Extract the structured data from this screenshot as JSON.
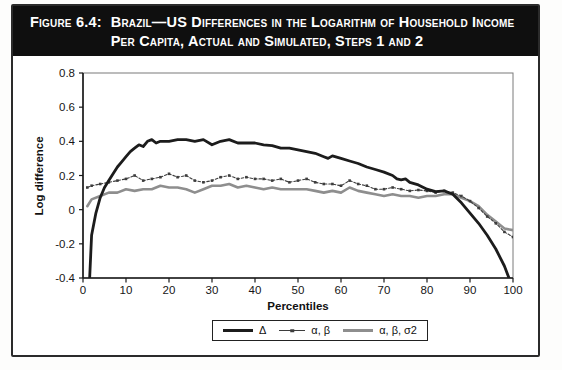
{
  "figure": {
    "label": "Figure 6.4:",
    "title": "Brazil—US Differences in the Logarithm of Household Income Per Capita, Actual and Simulated, Steps 1 and 2"
  },
  "chart_data": {
    "type": "line",
    "title": "",
    "xlabel": "Percentiles",
    "ylabel": "Log difference",
    "xlim": [
      0,
      100
    ],
    "ylim": [
      -0.4,
      0.8
    ],
    "x_ticks": [
      0,
      10,
      20,
      30,
      40,
      50,
      60,
      70,
      80,
      90,
      100
    ],
    "y_ticks": [
      0.8,
      0.6,
      0.4,
      0.2,
      0,
      -0.2,
      -0.4
    ],
    "grid": false,
    "legend_position": "bottom-center",
    "frame_color": "#7a7a7a",
    "axis_color": "#1a1a1a",
    "series": [
      {
        "name": "Δ",
        "style": "solid-thick",
        "color": "#1c1c1c",
        "x": [
          1.5,
          2,
          3,
          4,
          5,
          6,
          7,
          8,
          9,
          10,
          11,
          12,
          13,
          14,
          15,
          16,
          17,
          18,
          20,
          22,
          24,
          26,
          28,
          30,
          31,
          32,
          34,
          36,
          38,
          40,
          42,
          44,
          46,
          48,
          50,
          52,
          54,
          56,
          57,
          58,
          60,
          62,
          64,
          66,
          68,
          70,
          72,
          73,
          74,
          75,
          76,
          78,
          80,
          82,
          84,
          86,
          88,
          90,
          92,
          94,
          96,
          98,
          99.5
        ],
        "values": [
          -0.42,
          -0.15,
          -0.02,
          0.07,
          0.13,
          0.17,
          0.21,
          0.25,
          0.28,
          0.31,
          0.34,
          0.36,
          0.38,
          0.37,
          0.4,
          0.41,
          0.39,
          0.4,
          0.4,
          0.41,
          0.41,
          0.4,
          0.41,
          0.38,
          0.39,
          0.4,
          0.41,
          0.39,
          0.39,
          0.39,
          0.38,
          0.375,
          0.36,
          0.36,
          0.35,
          0.34,
          0.33,
          0.31,
          0.3,
          0.315,
          0.3,
          0.285,
          0.27,
          0.25,
          0.235,
          0.22,
          0.2,
          0.18,
          0.175,
          0.18,
          0.16,
          0.145,
          0.12,
          0.105,
          0.11,
          0.09,
          0.04,
          -0.02,
          -0.08,
          -0.15,
          -0.23,
          -0.33,
          -0.43
        ]
      },
      {
        "name": "α, β",
        "style": "dashed-square-markers",
        "color": "#3d3d3d",
        "x": [
          1,
          2,
          4,
          6,
          8,
          10,
          12,
          14,
          16,
          18,
          20,
          22,
          24,
          26,
          28,
          30,
          32,
          34,
          36,
          38,
          40,
          42,
          44,
          46,
          48,
          50,
          52,
          54,
          56,
          58,
          60,
          62,
          64,
          66,
          68,
          70,
          72,
          74,
          76,
          78,
          80,
          82,
          84,
          86,
          88,
          90,
          92,
          94,
          96,
          98,
          100
        ],
        "values": [
          0.13,
          0.14,
          0.15,
          0.16,
          0.17,
          0.18,
          0.2,
          0.17,
          0.18,
          0.19,
          0.21,
          0.19,
          0.2,
          0.17,
          0.16,
          0.17,
          0.19,
          0.2,
          0.18,
          0.19,
          0.18,
          0.18,
          0.17,
          0.18,
          0.16,
          0.17,
          0.18,
          0.16,
          0.15,
          0.15,
          0.14,
          0.17,
          0.15,
          0.14,
          0.12,
          0.12,
          0.13,
          0.12,
          0.11,
          0.115,
          0.11,
          0.1,
          0.11,
          0.1,
          0.08,
          0.05,
          0.01,
          -0.04,
          -0.08,
          -0.13,
          -0.16
        ]
      },
      {
        "name": "α, β, σ2",
        "style": "solid",
        "color": "#8e8e8e",
        "x": [
          1,
          2,
          4,
          6,
          8,
          10,
          12,
          14,
          16,
          18,
          20,
          22,
          24,
          26,
          28,
          30,
          32,
          34,
          36,
          38,
          40,
          42,
          44,
          46,
          48,
          50,
          52,
          54,
          56,
          58,
          60,
          62,
          64,
          66,
          68,
          70,
          72,
          74,
          76,
          78,
          80,
          82,
          84,
          86,
          88,
          90,
          92,
          94,
          96,
          98,
          100
        ],
        "values": [
          0.02,
          0.06,
          0.08,
          0.1,
          0.1,
          0.12,
          0.11,
          0.12,
          0.12,
          0.14,
          0.13,
          0.13,
          0.12,
          0.1,
          0.12,
          0.14,
          0.14,
          0.15,
          0.13,
          0.14,
          0.13,
          0.12,
          0.13,
          0.12,
          0.12,
          0.12,
          0.12,
          0.11,
          0.1,
          0.11,
          0.1,
          0.13,
          0.11,
          0.1,
          0.09,
          0.08,
          0.09,
          0.08,
          0.08,
          0.07,
          0.08,
          0.08,
          0.09,
          0.09,
          0.07,
          0.05,
          0.02,
          -0.03,
          -0.07,
          -0.11,
          -0.12
        ]
      }
    ]
  }
}
